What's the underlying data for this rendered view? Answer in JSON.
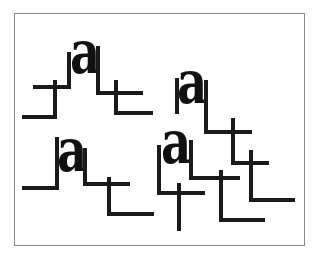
{
  "figure": {
    "glyph": "a",
    "colors": {
      "ink": "#1a1a1a",
      "frame": "#8a8a8a",
      "background": "#ffffff"
    },
    "clusters": [
      {
        "id": 1,
        "glyph": "a",
        "position": "top-left"
      },
      {
        "id": 2,
        "glyph": "a",
        "position": "top-right"
      },
      {
        "id": 3,
        "glyph": "a",
        "position": "bottom-left"
      },
      {
        "id": 4,
        "glyph": "a",
        "position": "bottom-right"
      }
    ]
  }
}
